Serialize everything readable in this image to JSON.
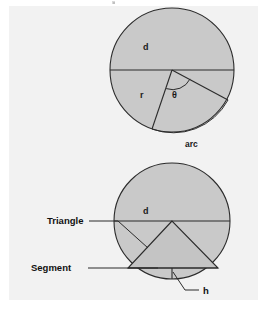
{
  "figure": {
    "background_color": "#f2f2f2",
    "page_color": "#ffffff",
    "shape_fill_color": "#c9c9c9",
    "line_color": "#2b2b2b",
    "text_color": "#1a1a1a"
  },
  "upper_circle": {
    "name": "circle-with-sector",
    "center_x": 172,
    "center_y": 70,
    "radius": 62,
    "labels": {
      "diameter": "d",
      "radius": "r",
      "angle": "θ",
      "arc": "arc"
    }
  },
  "lower_circle": {
    "name": "circle-with-triangle-and-segment",
    "center_x": 172,
    "center_y": 221,
    "radius": 58,
    "labels": {
      "diameter": "d",
      "triangle": "Triangle",
      "segment": "Segment",
      "height": "h"
    }
  },
  "callouts": [
    {
      "label": "Triangle",
      "target": "triangle-left-side"
    },
    {
      "label": "Segment",
      "target": "circular-segment-region"
    },
    {
      "label": "h",
      "target": "segment-height-line"
    }
  ]
}
